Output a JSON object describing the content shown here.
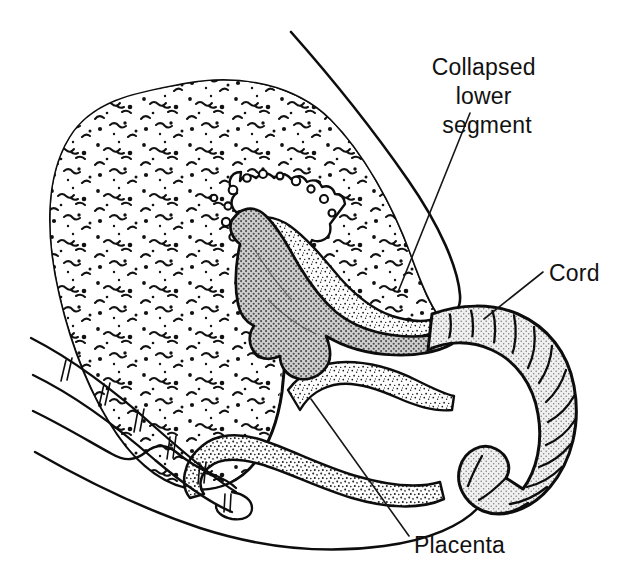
{
  "figure": {
    "background_color": "#ffffff",
    "ink_color": "#0d0d0d",
    "width": 626,
    "height": 588
  },
  "annotations": [
    {
      "id": "collapsed-lower-segment",
      "lines": [
        "Collapsed",
        "lower",
        "segment"
      ],
      "text_anchor": "middle",
      "x": 487,
      "y": 75,
      "line_height": 29,
      "leader": "M 470 113 L 398 292"
    },
    {
      "id": "cord",
      "lines": [
        "Cord"
      ],
      "text_anchor": "start",
      "x": 549,
      "y": 281,
      "line_height": 29,
      "leader": "M 543 272 L 484 319"
    },
    {
      "id": "placenta",
      "lines": [
        "Placenta"
      ],
      "text_anchor": "start",
      "x": 414,
      "y": 553,
      "line_height": 29,
      "leader": "M 409 536 L 311 399"
    }
  ],
  "structures": [
    {
      "id": "abdominal-wall",
      "label": "Anterior abdominal wall",
      "fill": "none",
      "stroke_width": 2.6
    },
    {
      "id": "uterus-body",
      "label": "Uterus (myometrium, stippled)",
      "fill": "#ffffff",
      "stroke_width": 3.0
    },
    {
      "id": "endometrial-cavity",
      "label": "Endometrial cavity lining (beaded)",
      "fill": "#ffffff",
      "stroke_width": 2.2
    },
    {
      "id": "placenta-mass",
      "label": "Placenta",
      "fill": "#b4b4b4",
      "stroke_width": 2.6
    },
    {
      "id": "membranes",
      "label": "Fetal membranes (fine stipple)",
      "fill": "#f7f7f7",
      "stroke_width": 2.4
    },
    {
      "id": "umbilical-cord",
      "label": "Umbilical cord (segmented, light stipple)",
      "fill": "#e2e2e2",
      "stroke_width": 3.0
    },
    {
      "id": "vaginal-canal",
      "label": "Vagina / posterior wall band",
      "fill": "#f5f5f5",
      "stroke_width": 2.4
    },
    {
      "id": "sacrum",
      "label": "Sacrum and coccyx with segments",
      "fill": "none",
      "stroke_width": 2.2
    },
    {
      "id": "perineum",
      "label": "Perineum / buttock contour",
      "fill": "none",
      "stroke_width": 2.4
    }
  ]
}
